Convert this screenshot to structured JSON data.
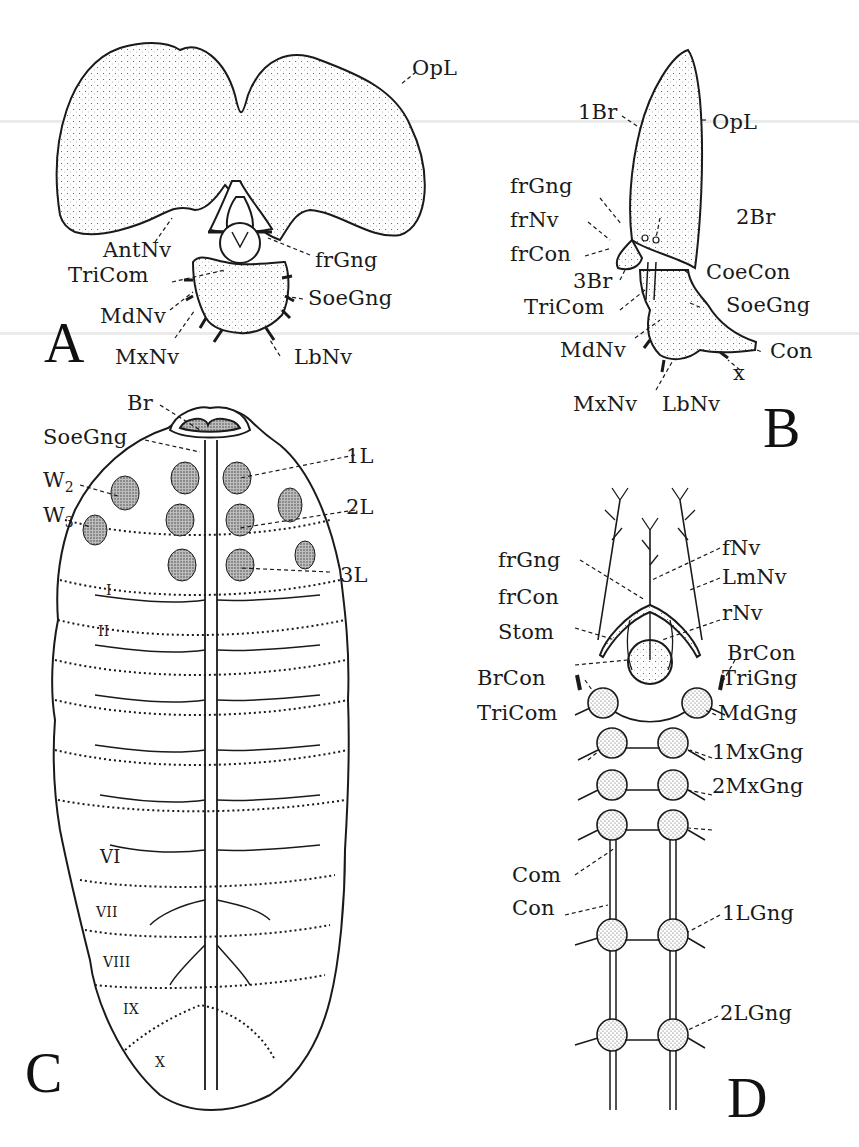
{
  "figure": {
    "colors": {
      "ink": "#1a1a1a",
      "paper": "#ffffff",
      "stipple": "#555555"
    }
  },
  "panelA": {
    "letter": "A",
    "labels": {
      "OpL": "OpL",
      "AntNv": "AntNv",
      "frGng": "frGng",
      "TriCom": "TriCom",
      "SoeGng": "SoeGng",
      "MdNv": "MdNv",
      "MxNv": "MxNv",
      "LbNv": "LbNv"
    }
  },
  "panelB": {
    "letter": "B",
    "labels": {
      "1Br": "1Br",
      "OpL": "OpL",
      "frGng": "frGng",
      "frNv": "frNv",
      "2Br": "2Br",
      "frCon": "frCon",
      "CoeCon": "CoeCon",
      "3Br": "3Br",
      "TriCom": "TriCom",
      "SoeGng": "SoeGng",
      "MdNv": "MdNv",
      "Con": "Con",
      "x": "x",
      "MxNv": "MxNv",
      "LbNv": "LbNv"
    }
  },
  "panelC": {
    "letter": "C",
    "labels": {
      "Br": "Br",
      "SoeGng": "SoeGng",
      "1L": "1L",
      "W2": "W",
      "W2_sub": "2",
      "W3": "W",
      "W3_sub": "3",
      "2L": "2L",
      "3L": "3L"
    },
    "segments": [
      "I",
      "II",
      "VI",
      "VII",
      "VIII",
      "IX",
      "X"
    ]
  },
  "panelD": {
    "letter": "D",
    "labels": {
      "fNv": "fNv",
      "frGng": "frGng",
      "LmNv": "LmNv",
      "frCon": "frCon",
      "rNv": "rNv",
      "Stom": "Stom",
      "BrCon_right": "BrCon",
      "BrCon_left": "BrCon",
      "TriGng": "TriGng",
      "TriCom": "TriCom",
      "MdGng": "MdGng",
      "1MxGng": "1MxGng",
      "2MxGng": "2MxGng",
      "Com": "Com",
      "Con": "Con",
      "1LGng": "1LGng",
      "2LGng": "2LGng"
    }
  }
}
